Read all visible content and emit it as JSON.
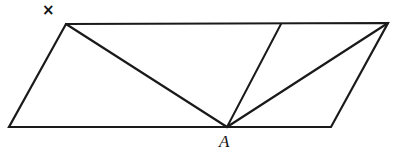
{
  "figure": {
    "background_color": "#ffffff",
    "stroke_color": "#1a1a1a",
    "stroke_width": 2.2,
    "labels": {
      "x_marker": "×",
      "vertex_a": "A"
    },
    "points": {
      "top_left": {
        "x": 66,
        "y": 24
      },
      "top_right": {
        "x": 388,
        "y": 23
      },
      "bottom_right": {
        "x": 331,
        "y": 127
      },
      "bottom_left": {
        "x": 9,
        "y": 127
      },
      "a": {
        "x": 227,
        "y": 127
      },
      "top_mid": {
        "x": 281,
        "y": 24
      },
      "x_marker": {
        "x": 49,
        "y": 11
      },
      "a_label": {
        "x": 226,
        "y": 143
      }
    },
    "outline_path": "M 66 24 L 388 23 L 331 127 L 9 127 Z",
    "inner_segments": [
      {
        "name": "a-to-top-left",
        "path": "M 227 127 L 66 24"
      },
      {
        "name": "a-to-top-mid",
        "path": "M 227 127 L 281 24"
      },
      {
        "name": "a-to-top-right",
        "path": "M 227 127 L 388 23"
      }
    ]
  }
}
